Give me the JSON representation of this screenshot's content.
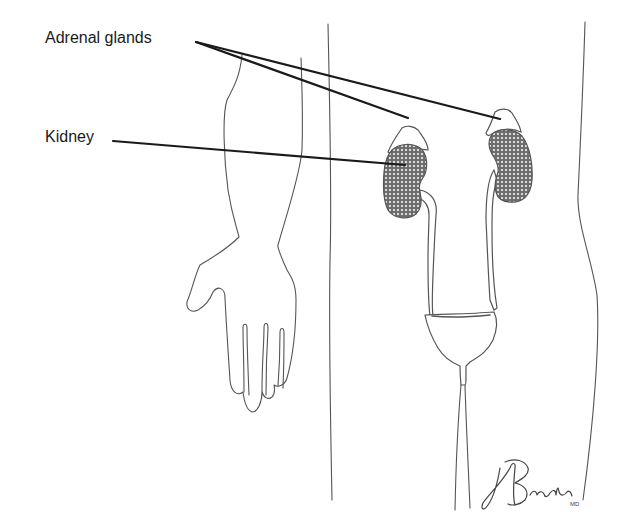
{
  "figure": {
    "type": "anatomical line drawing"
  },
  "labels": [
    {
      "id": "adrenal",
      "text": "Adrenal glands",
      "x": 45,
      "y": 29,
      "targets": [
        [
          408,
          118
        ],
        [
          500,
          119
        ]
      ],
      "origin": [
        196,
        42
      ]
    },
    {
      "id": "kidney",
      "text": "Kidney",
      "x": 45,
      "y": 129,
      "targets": [
        [
          405,
          165
        ]
      ],
      "origin": [
        113,
        141
      ]
    }
  ],
  "signature": {
    "text": "JABrada",
    "suffix": "MD"
  },
  "colors": {
    "background": "#ffffff",
    "line": "#555555",
    "leader": "#1a1a1a",
    "kidney_fill": "#6e6e6e",
    "kidney_dots": "#ffffff"
  }
}
